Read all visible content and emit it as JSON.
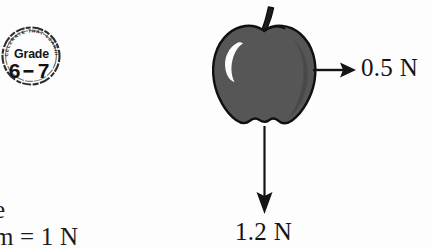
{
  "figure": {
    "kind": "free-body-force-diagram",
    "background_color": "#fdfdfd",
    "ink_color": "#141414"
  },
  "badge": {
    "name": "grade-stamp",
    "heading": "Grade",
    "value": "6-7",
    "separator": "-",
    "ring_text": "ACCELERATE THAT LEARNING",
    "shape": "circle-stamp",
    "color": "#1b1b1b"
  },
  "apple": {
    "name": "apple-illustration",
    "body_color": "#565656",
    "shade_color": "#494949",
    "outline_color": "#101010",
    "stem_color": "#1d1d1d",
    "highlight_color": "#fcfcfc",
    "highlight_shape": "crescent"
  },
  "forces": [
    {
      "id": "applied-force",
      "label": "0.5 N",
      "magnitude": 0.5,
      "unit": "N",
      "direction": "right",
      "arrow_color": "#141414"
    },
    {
      "id": "weight-force",
      "label": "1.2 N",
      "magnitude": 1.2,
      "unit": "N",
      "direction": "down",
      "arrow_color": "#141414"
    }
  ],
  "caption": {
    "name": "figure-caption-cropped",
    "lines": [
      "e",
      "m = 1 N"
    ],
    "note_cropped_left": true
  }
}
